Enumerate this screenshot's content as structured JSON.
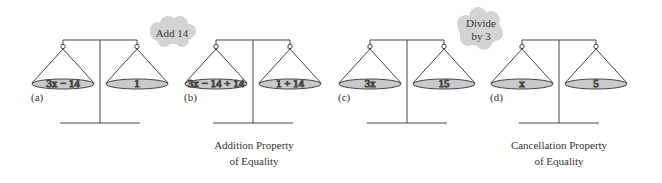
{
  "figure": {
    "scales": [
      {
        "id": "a",
        "label": "(a)",
        "left": "3x − 14",
        "right": "1",
        "cx": 100
      },
      {
        "id": "b",
        "label": "(b)",
        "left": "3x − 14 + 14",
        "right": "1 + 14",
        "cx": 253
      },
      {
        "id": "c",
        "label": "(c)",
        "left": "3x",
        "right": "15",
        "cx": 407
      },
      {
        "id": "d",
        "label": "(d)",
        "left": "x",
        "right": "5",
        "cx": 559
      }
    ],
    "bubbles": [
      {
        "text": "Add 14"
      },
      {
        "line1": "Divide",
        "line2": "by 3"
      }
    ],
    "captions": [
      {
        "line1": "Addition Property",
        "line2": "of Equality"
      },
      {
        "line1": "Cancellation Property",
        "line2": "of Equality"
      }
    ],
    "colors": {
      "pan": "#c9c9c9",
      "line": "#444444",
      "bubble": "#d4d4d4"
    }
  }
}
